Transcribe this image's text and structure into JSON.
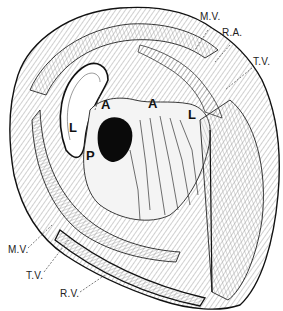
{
  "figure": {
    "colors": {
      "ink": "#111111",
      "paper": "#ffffff",
      "hatch": "#777777",
      "cavity": "#0a0a0a"
    }
  },
  "labels": {
    "outer": [
      {
        "id": "mv_top",
        "text": "M.V.",
        "x": 200,
        "y": 18
      },
      {
        "id": "ra",
        "text": "R.A.",
        "x": 222,
        "y": 33
      },
      {
        "id": "tv_top",
        "text": "T.V.",
        "x": 253,
        "y": 62
      },
      {
        "id": "mv_bottom",
        "text": "M.V.",
        "x": 10,
        "y": 250
      },
      {
        "id": "tv_bottom",
        "text": "T.V.",
        "x": 26,
        "y": 275
      },
      {
        "id": "rv",
        "text": "R.V.",
        "x": 60,
        "y": 293
      }
    ],
    "inner": [
      {
        "id": "a_left",
        "text": "A",
        "x": 101,
        "y": 104
      },
      {
        "id": "a_right",
        "text": "A",
        "x": 148,
        "y": 103
      },
      {
        "id": "l_left",
        "text": "L",
        "x": 68,
        "y": 126
      },
      {
        "id": "l_right",
        "text": "L",
        "x": 188,
        "y": 113
      },
      {
        "id": "p",
        "text": "P",
        "x": 85,
        "y": 154
      }
    ]
  }
}
